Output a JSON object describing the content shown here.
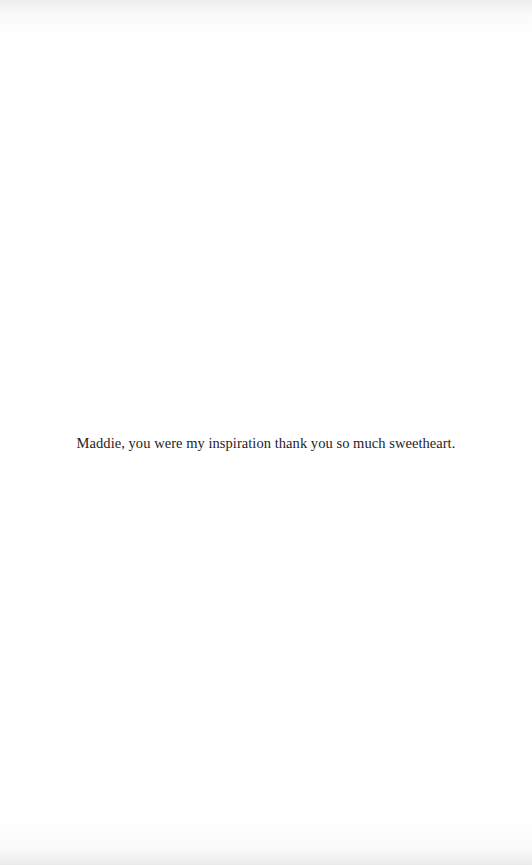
{
  "page": {
    "background": "#ffffff",
    "text_color": "#1e1e1e",
    "dedication": "Maddie, you were my inspiration thank you so much sweetheart."
  }
}
